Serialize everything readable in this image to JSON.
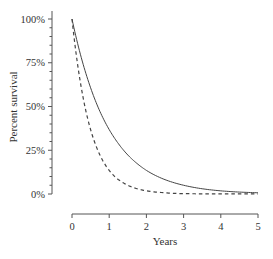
{
  "chart_data": {
    "type": "line",
    "title": "",
    "xlabel": "Years",
    "ylabel": "Percent survival",
    "xlim": [
      0,
      5
    ],
    "ylim": [
      0,
      100
    ],
    "x_ticks": [
      "0",
      "1",
      "2",
      "3",
      "4",
      "5"
    ],
    "y_ticks": [
      "0%",
      "25%",
      "50%",
      "75%",
      "100%"
    ],
    "grid": false,
    "legend": null,
    "x": [
      0,
      0.25,
      0.5,
      0.75,
      1,
      1.25,
      1.5,
      1.75,
      2,
      2.5,
      3,
      3.5,
      4,
      4.5,
      5
    ],
    "series": [
      {
        "name": "solid",
        "style": "solid",
        "values": [
          100,
          77.9,
          60.7,
          47.2,
          36.8,
          28.7,
          22.3,
          17.4,
          13.5,
          8.2,
          5.0,
          3.0,
          1.8,
          1.1,
          0.7
        ]
      },
      {
        "name": "dashed",
        "style": "dashed",
        "values": [
          100,
          60.7,
          36.8,
          22.3,
          13.5,
          8.2,
          5.0,
          3.0,
          1.8,
          0.7,
          0.2,
          0.1,
          0.0,
          0.0,
          0.0
        ]
      }
    ]
  },
  "colors": {
    "axis": "#555555",
    "line": "#444444",
    "text": "#333333"
  }
}
